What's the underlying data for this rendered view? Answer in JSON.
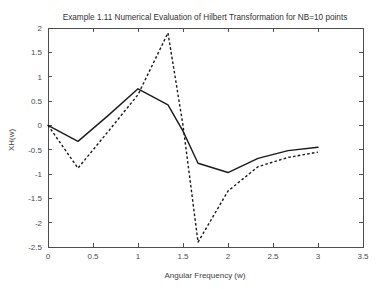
{
  "chart_data": {
    "type": "line",
    "title": "Example 1.11 Numerical Evaluation of Hilbert Transformation for NB=10 points",
    "xlabel": "Angular Frequency (w)",
    "ylabel": "XH(w)",
    "xlim": [
      0,
      3.5
    ],
    "ylim": [
      -2.5,
      2
    ],
    "xticks": [
      0,
      0.5,
      1,
      1.5,
      2,
      2.5,
      3,
      3.5
    ],
    "xticklabels": [
      "0",
      "0.5",
      "1",
      "1.5",
      "2",
      "2.5",
      "3",
      "3.5"
    ],
    "yticks": [
      -2.5,
      -2,
      -1.5,
      -1,
      -0.5,
      0,
      0.5,
      1,
      1.5,
      2
    ],
    "yticklabels": [
      "-2.5",
      "-2",
      "-1.5",
      "-1",
      "-0.5",
      "0",
      "0.5",
      "1",
      "1.5",
      "2"
    ],
    "grid": false,
    "legend": "none",
    "series": [
      {
        "name": "solid-curve",
        "style": "solid",
        "color": "#1a1a1a",
        "x": [
          0.0,
          0.333,
          0.667,
          1.0,
          1.333,
          1.5,
          1.667,
          2.0,
          2.333,
          2.667,
          3.0
        ],
        "y": [
          0.0,
          -0.33,
          0.2,
          0.75,
          0.42,
          -0.12,
          -0.78,
          -0.97,
          -0.68,
          -0.52,
          -0.45
        ]
      },
      {
        "name": "dashed-curve",
        "style": "dashed",
        "color": "#1a1a1a",
        "x": [
          0.0,
          0.333,
          0.667,
          1.0,
          1.333,
          1.5,
          1.667,
          2.0,
          2.333,
          2.667,
          3.0
        ],
        "y": [
          0.0,
          -0.88,
          -0.13,
          0.63,
          1.9,
          0.0,
          -2.4,
          -1.35,
          -0.85,
          -0.66,
          -0.55
        ]
      }
    ]
  }
}
